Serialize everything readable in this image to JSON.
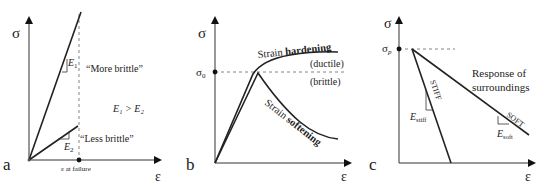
{
  "panels": {
    "a": {
      "label": "a",
      "y_axis": "σ",
      "x_axis": "ε",
      "x_marker": "ε at failure",
      "line1_label": "“More brittle”",
      "line2_label": "“Less brittle”",
      "slope1": "E",
      "slope1_sub": "1",
      "slope2": "E",
      "slope2_sub": "2",
      "relation": "E₁ > E₂"
    },
    "b": {
      "label": "b",
      "y_axis": "σ",
      "x_axis": "ε",
      "y_marker": "σ",
      "y_marker_sub": "0",
      "hardening_prefix": "Strain ",
      "hardening_bold": "hardening",
      "softening_prefix": "Strain ",
      "softening_bold": "softening",
      "ductile": "(ductile)",
      "brittle": "(brittle)"
    },
    "c": {
      "label": "c",
      "y_axis": "σ",
      "x_axis": "ε",
      "y_marker": "σ",
      "y_marker_sub": "p",
      "stiff_label": "STIFF",
      "soft_label": "SOFT",
      "stiff_slope": "E",
      "stiff_slope_sub": "stiff",
      "soft_slope": "E",
      "soft_slope_sub": "soft",
      "response_line1": "Response of",
      "response_line2": "surroundings"
    }
  }
}
